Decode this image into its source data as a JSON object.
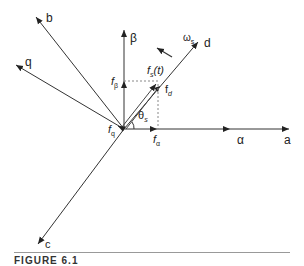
{
  "diagram": {
    "type": "vector-diagram",
    "axes": {
      "a": "a",
      "b": "b",
      "c": "c",
      "alpha": "α",
      "beta": "β",
      "d": "d",
      "q": "q"
    },
    "labels": {
      "fs": "f",
      "fs_sub": "s",
      "fs_t": "(t)",
      "f_alpha": "f",
      "f_alpha_sub": "α",
      "f_beta": "f",
      "f_beta_sub": "β",
      "f_d": "f",
      "f_d_sub": "d",
      "f_q": "f",
      "f_q_sub": "q",
      "theta": "θ",
      "theta_sub": "s",
      "omega": "ω",
      "omega_sub": "s"
    },
    "caption": "FIGURE 6.1"
  }
}
